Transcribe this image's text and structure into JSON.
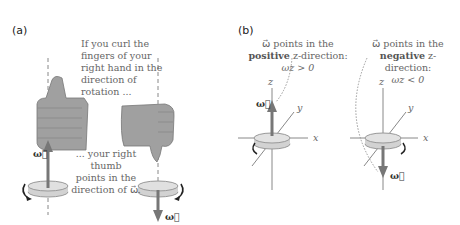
{
  "panel_a": {
    "label": "(a)",
    "top_text": [
      "If you curl the",
      "fingers of your",
      "right hand in the",
      "direction of",
      "rotation ..."
    ],
    "bottom_text": [
      "... your right thumb",
      "points in the",
      "direction of ω⃗."
    ],
    "omega_up_label": "ω⃗",
    "omega_down_label": "ω⃗"
  },
  "panel_b": {
    "label": "(b)",
    "left_caption": {
      "line1": "ω⃗ points in the",
      "line2_bold": "positive",
      "line2_rest": " z-direction:",
      "line3": "ωz > 0"
    },
    "right_caption": {
      "line1": "ω⃗ points in the",
      "line2_bold": "negative",
      "line2_rest": " z-direction:",
      "line3": "ωz < 0"
    },
    "axes": {
      "x": "x",
      "y": "y",
      "z": "z"
    },
    "omega_label": "ω⃗"
  },
  "colors": {
    "hand": "#9a9a9a",
    "arrow": "#777777",
    "gear": "#d2d2d2",
    "text": "#666666"
  }
}
